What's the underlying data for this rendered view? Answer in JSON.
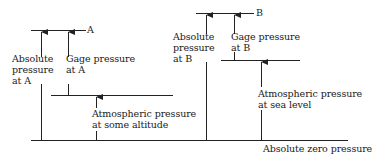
{
  "diagram": {
    "type": "pressure-reference-levels",
    "line_color": "#222222",
    "levels": {
      "point_a": {
        "label": "A"
      },
      "point_b": {
        "label": "B"
      },
      "atm_altitude": {},
      "atm_sea_level": {},
      "absolute_zero": {
        "label": "Absolute zero pressure"
      }
    },
    "labels": {
      "absolute_a": {
        "line1": "Absolute",
        "line2": "pressure",
        "line3": "at A"
      },
      "gage_a": {
        "line1": "Gage pressure",
        "line2": "at A"
      },
      "atm_altitude": {
        "line1": "Atmospheric pressure",
        "line2": "at some altitude"
      },
      "absolute_b": {
        "line1": "Absolute",
        "line2": "pressure",
        "line3": "at B"
      },
      "gage_b": {
        "line1": "Gage pressure",
        "line2": "at B"
      },
      "atm_sea_level": {
        "line1": "Atmospheric pressure",
        "line2": "at sea level"
      }
    }
  }
}
